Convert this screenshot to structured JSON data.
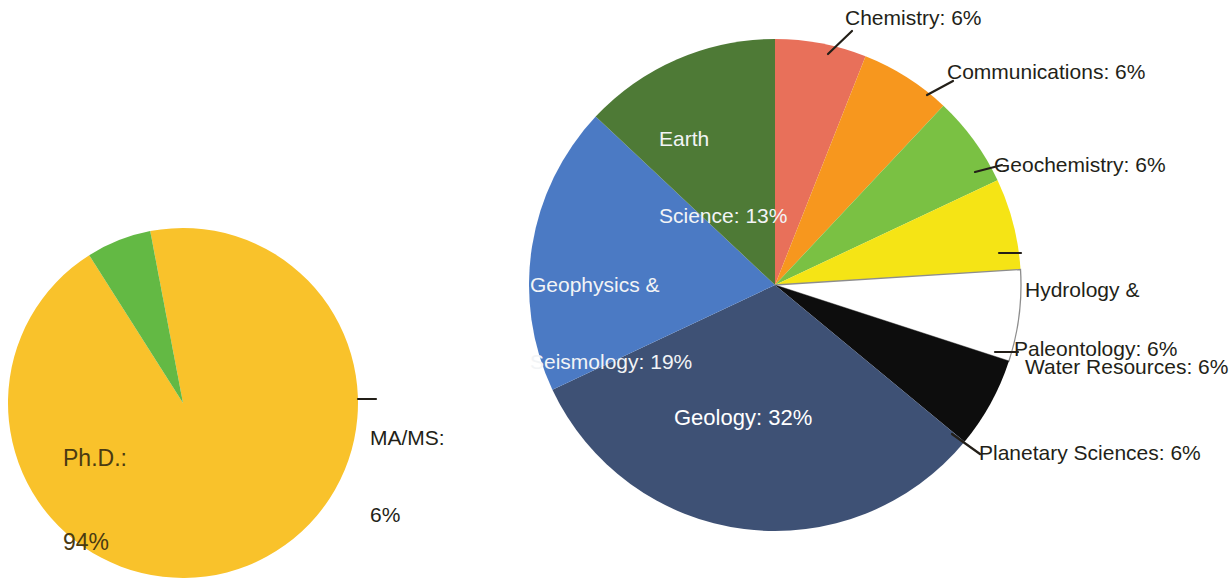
{
  "figure": {
    "background_color": "#ffffff",
    "width": 1231,
    "height": 583
  },
  "chart_data": [
    {
      "type": "pie",
      "name": "degree-pie",
      "title": "",
      "categories": [
        "Ph.D.",
        "MA/MS"
      ],
      "values": [
        94,
        6
      ],
      "unit": "%",
      "colors": [
        "#f9c22b",
        "#63b944"
      ],
      "center": [
        183,
        403
      ],
      "radius": 175,
      "start_angle_deg": 349.2,
      "labels": [
        {
          "key": "phd",
          "text": "Ph.D.:\n94%",
          "line1": "Ph.D.:",
          "line2": "94%",
          "value": 94,
          "placement": "inside",
          "text_color": "#4a3a12",
          "x": 63,
          "y": 388
        },
        {
          "key": "mams",
          "text": "MA/MS:\n6%",
          "line1": "MA/MS:",
          "line2": "6%",
          "value": 6,
          "placement": "outside",
          "text_color": "#231f18",
          "x": 370,
          "y": 374,
          "leader": true
        }
      ],
      "legend": "none",
      "grid": false
    },
    {
      "type": "pie",
      "name": "discipline-pie",
      "title": "",
      "categories": [
        "Chemistry",
        "Communications",
        "Geochemistry",
        "Hydrology & Water Resources",
        "Paleontology",
        "Planetary Sciences",
        "Geology",
        "Geophysics & Seismology",
        "Earth Science"
      ],
      "values": [
        6,
        6,
        6,
        6,
        6,
        6,
        32,
        19,
        13
      ],
      "unit": "%",
      "colors": [
        "#e8705a",
        "#f7971e",
        "#7ac143",
        "#f5e415",
        "#ffffff",
        "#0d0d0d",
        "#3e5175",
        "#4b7ac4",
        "#4e7a36"
      ],
      "stroke_colors": [
        "none",
        "none",
        "none",
        "none",
        "#8d8d8d",
        "none",
        "none",
        "none",
        "none"
      ],
      "center": [
        775,
        285
      ],
      "radius": 246,
      "start_angle_deg": 0,
      "direction": "clockwise",
      "labels": [
        {
          "key": "chemistry",
          "text": "Chemistry: 6%",
          "value": 6,
          "placement": "outside",
          "text_color": "#231f18",
          "x": 845,
          "y": 5,
          "leader": true
        },
        {
          "key": "communications",
          "text": "Communications: 6%",
          "value": 6,
          "placement": "outside",
          "text_color": "#231f18",
          "x": 947,
          "y": 59,
          "leader": true
        },
        {
          "key": "geochemistry",
          "text": "Geochemistry: 6%",
          "value": 6,
          "placement": "outside",
          "text_color": "#231f18",
          "x": 994,
          "y": 152,
          "leader": true
        },
        {
          "key": "hydrology",
          "text": "Hydrology &\nWater Resources: 6%",
          "line1": "Hydrology &",
          "line2": "Water Resources: 6%",
          "value": 6,
          "placement": "outside",
          "text_color": "#231f18",
          "x": 1025,
          "y": 226,
          "leader": true
        },
        {
          "key": "paleontology",
          "text": "Paleontology: 6%",
          "value": 6,
          "placement": "outside",
          "text_color": "#231f18",
          "x": 1014,
          "y": 336,
          "leader": true
        },
        {
          "key": "planetary",
          "text": "Planetary Sciences: 6%",
          "value": 6,
          "placement": "outside",
          "text_color": "#231f18",
          "x": 979,
          "y": 440,
          "leader": true
        },
        {
          "key": "geology",
          "text": "Geology: 32%",
          "value": 32,
          "placement": "inside",
          "text_color": "#ffffff",
          "x": 674,
          "y": 405
        },
        {
          "key": "geophysics",
          "text": "Geophysics &\nSeismology: 19%",
          "line1": "Geophysics &",
          "line2": "Seismology: 19%",
          "value": 19,
          "placement": "inside",
          "text_color": "#ffffff",
          "x": 530,
          "y": 221
        },
        {
          "key": "earthscience",
          "text": "Earth\nScience: 13%",
          "line1": "Earth",
          "line2": "Science: 13%",
          "value": 13,
          "placement": "inside",
          "text_color": "#ffffff",
          "x": 659,
          "y": 75
        }
      ],
      "legend": "none",
      "grid": false
    }
  ]
}
